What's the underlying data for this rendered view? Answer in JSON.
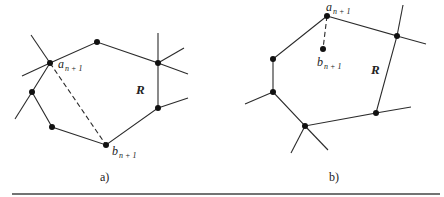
{
  "figure": {
    "panels": [
      {
        "id": "a",
        "caption": "a)",
        "region_label": "R",
        "label_a": "a",
        "label_a_sub": "n + 1",
        "label_b": "b",
        "label_b_sub": "n + 1",
        "connector": "dashed edge from a_{n+1} to b_{n+1} across region R"
      },
      {
        "id": "b",
        "caption": "b)",
        "region_label": "R",
        "label_a": "a",
        "label_a_sub": "n + 1",
        "label_b": "b",
        "label_b_sub": "n + 1",
        "connector": "dashed edge from a_{n+1} to interior point b_{n+1}"
      }
    ]
  }
}
